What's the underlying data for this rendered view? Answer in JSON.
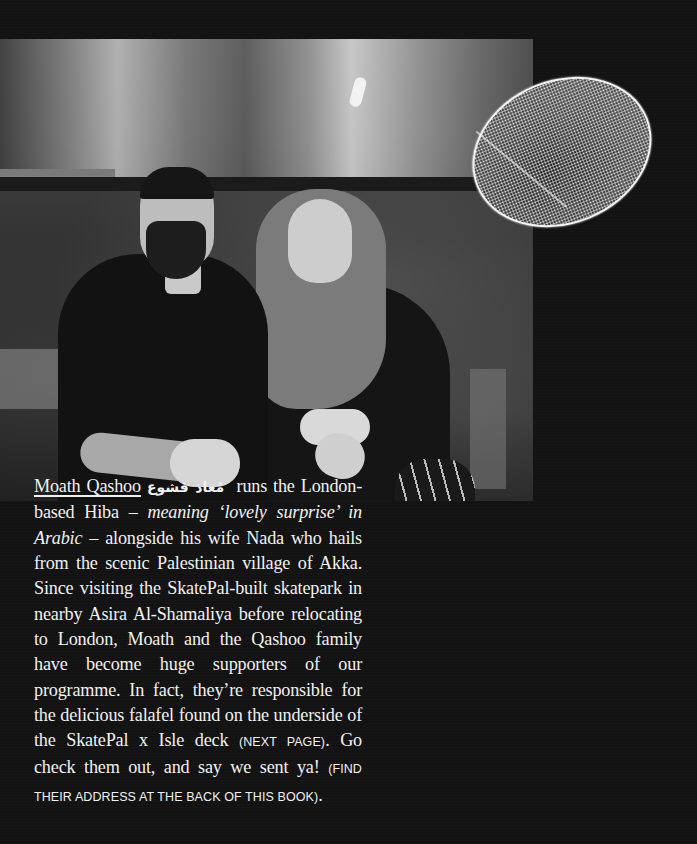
{
  "photo": {
    "description": "Black-and-white photo of Moath Qashoo and his wife Nada seated in a kitchen"
  },
  "falafel_graphic": {
    "description": "Halftone cut-out of a falafel"
  },
  "article": {
    "name": "Moath Qashoo",
    "name_arabic": "مُعاذ قشوع",
    "text_1": " runs the London-based Hiba – ",
    "italic_1": "meaning ‘lovely surprise’ in Arabic",
    "text_2": " – alongside his wife Nada who hails from the scenic Palestinian village of Akka. Since visiting the SkatePal-built skatepark in nearby Asira Al-Shamaliya before relocating to London, Moath and the Qashoo family have become huge supporters of our programme. In fact, they’re responsible for the delicious falafel found on the underside of the SkatePal x Isle deck ",
    "caps_1": "(NEXT PAGE)",
    "text_3": ". Go check them out, and say we sent ya! ",
    "caps_2": "(FIND THEIR ADDRESS AT THE BACK OF THIS BOOK)",
    "text_4": "."
  },
  "colors": {
    "background": "#131313",
    "text": "#f1f1f1"
  }
}
